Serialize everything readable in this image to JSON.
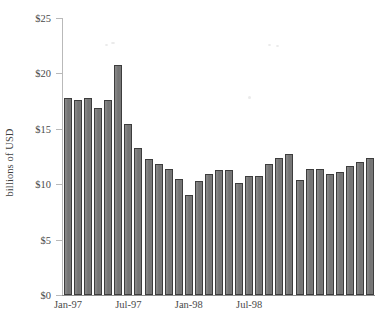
{
  "chart_data": {
    "type": "bar",
    "title": "",
    "xlabel": "",
    "ylabel": "billions of USD",
    "ylim": [
      0,
      25
    ],
    "ytick_values": [
      0,
      5,
      10,
      15,
      20,
      25
    ],
    "ytick_labels": [
      "$0",
      "$5",
      "$10",
      "$15",
      "$20",
      "$25"
    ],
    "grid": false,
    "legend": "none",
    "bar_color": "#787878",
    "bar_edge_color": "#3d3d3d",
    "axis_color": "#b9b9b9",
    "categories": [
      "Jan-97",
      "Feb-97",
      "Mar-97",
      "Apr-97",
      "May-97",
      "Jun-97",
      "Jul-97",
      "Aug-97",
      "Sep-97",
      "Oct-97",
      "Nov-97",
      "Dec-97",
      "Jan-98",
      "Feb-98",
      "Mar-98",
      "Apr-98",
      "May-98",
      "Jun-98",
      "Jul-98",
      "Aug-98",
      "Sep-98",
      "Oct-98",
      "Nov-98",
      "Dec-98",
      "Jan-99",
      "Feb-99",
      "Mar-99",
      "Apr-99",
      "May-99",
      "Jun-99",
      "Jul-99"
    ],
    "values": [
      17.8,
      17.6,
      17.8,
      16.9,
      17.6,
      20.8,
      15.4,
      13.3,
      12.3,
      11.8,
      11.4,
      10.5,
      9.0,
      10.3,
      10.9,
      11.3,
      11.3,
      10.1,
      10.7,
      10.7,
      11.8,
      12.4,
      12.7,
      10.4,
      11.4,
      11.4,
      10.9,
      11.1,
      11.6,
      12.0,
      12.4
    ],
    "xtick_labels": [
      {
        "label": "Jan-97",
        "category_index": 0
      },
      {
        "label": "Jul-97",
        "category_index": 6
      },
      {
        "label": "Jan-98",
        "category_index": 12
      },
      {
        "label": "Jul-98",
        "category_index": 18
      }
    ]
  }
}
